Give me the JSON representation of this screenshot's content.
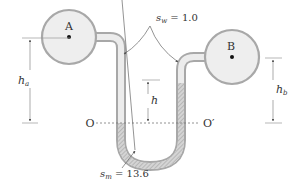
{
  "diagram": {
    "type": "differential-manometer",
    "labels": {
      "bulb_a": "A",
      "bulb_b": "B",
      "s_w_sym": "s",
      "s_w_sub": "w",
      "s_w_eq": " = 1.0",
      "s_m_sym": "s",
      "s_m_sub": "m",
      "s_m_eq": " = 13.6",
      "h_a_sym": "h",
      "h_a_sub": "a",
      "h_b_sym": "h",
      "h_b_sub": "b",
      "h": "h",
      "o_left": "O",
      "o_right": "O′"
    },
    "values": {
      "s_w": 1.0,
      "s_m": 13.6
    },
    "colors": {
      "tube_wall": "#a8a8a8",
      "fluid_water": "#e6e6e6",
      "fluid_mercury": "#cfcfcf",
      "hatch": "#9a9a9a",
      "line": "#555555",
      "dim_line": "#888888",
      "text": "#333333"
    }
  }
}
